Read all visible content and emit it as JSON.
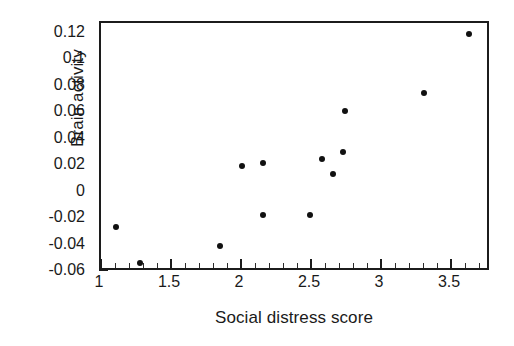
{
  "chart_data": {
    "type": "scatter",
    "title": "",
    "xlabel": "Social distress score",
    "ylabel": "Brain activity",
    "xlim": [
      1.0,
      3.785
    ],
    "ylim": [
      -0.06,
      0.1281
    ],
    "grid": false,
    "legend": null,
    "xticks": [
      "1",
      "1.5",
      "2",
      "2.5",
      "3",
      "3.5"
    ],
    "xtick_values": [
      1,
      1.5,
      2,
      2.5,
      3,
      3.5
    ],
    "x_minor_step": 0.1,
    "yticks": [
      "0.12",
      "0.1",
      "0.08",
      "0.06",
      "0.04",
      "0.02",
      "0",
      "-0.02",
      "-0.04",
      "-0.06"
    ],
    "ytick_values": [
      0.12,
      0.1,
      0.08,
      0.06,
      0.04,
      0.02,
      0,
      -0.02,
      -0.04,
      -0.06
    ],
    "y_minor_step": 0.005,
    "marker": "filled-circle",
    "marker_color": "#111111",
    "n_points": 13,
    "x": [
      1.11,
      1.28,
      1.85,
      2.01,
      2.16,
      2.16,
      2.49,
      2.58,
      2.66,
      2.73,
      2.74,
      3.31,
      3.63
    ],
    "y": [
      -0.026,
      -0.053,
      -0.04,
      0.02,
      0.022,
      -0.017,
      -0.017,
      0.025,
      0.014,
      0.031,
      0.062,
      0.075,
      0.12
    ],
    "points": [
      {
        "x": 1.11,
        "y": -0.026
      },
      {
        "x": 1.28,
        "y": -0.053
      },
      {
        "x": 1.85,
        "y": -0.04
      },
      {
        "x": 2.01,
        "y": 0.02
      },
      {
        "x": 2.16,
        "y": 0.022
      },
      {
        "x": 2.16,
        "y": -0.017
      },
      {
        "x": 2.49,
        "y": -0.017
      },
      {
        "x": 2.58,
        "y": 0.025
      },
      {
        "x": 2.66,
        "y": 0.014
      },
      {
        "x": 2.73,
        "y": 0.031
      },
      {
        "x": 2.74,
        "y": 0.062
      },
      {
        "x": 3.31,
        "y": 0.075
      },
      {
        "x": 3.63,
        "y": 0.12
      }
    ]
  },
  "axes": {
    "frame_color": "#1c1c1c"
  }
}
